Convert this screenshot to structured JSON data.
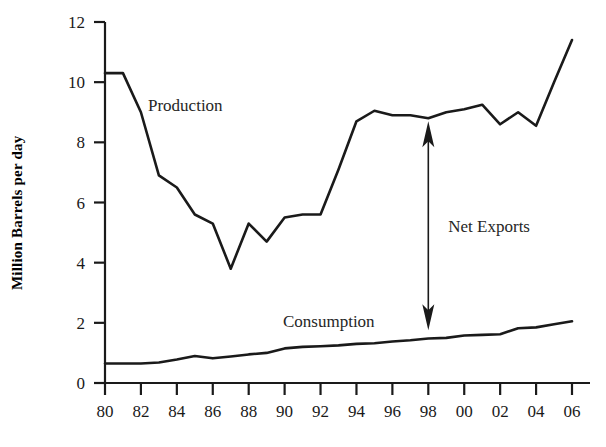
{
  "chart_data": {
    "type": "line",
    "title": "",
    "xlabel": "",
    "ylabel": "Million Barrels per day",
    "xlim": [
      1980,
      2006
    ],
    "ylim": [
      0,
      12
    ],
    "grid": false,
    "legend_position": "inline-annotation",
    "x": [
      1980,
      1981,
      1982,
      1983,
      1984,
      1985,
      1986,
      1987,
      1988,
      1989,
      1990,
      1991,
      1992,
      1993,
      1994,
      1995,
      1996,
      1997,
      1998,
      1999,
      2000,
      2001,
      2002,
      2003,
      2004,
      2005,
      2006
    ],
    "xtick_labels": [
      "80",
      "82",
      "84",
      "86",
      "88",
      "90",
      "92",
      "94",
      "96",
      "98",
      "00",
      "02",
      "04",
      "06"
    ],
    "xtick_values": [
      1980,
      1982,
      1984,
      1986,
      1988,
      1990,
      1992,
      1994,
      1996,
      1998,
      2000,
      2002,
      2004,
      2006
    ],
    "ytick_labels": [
      "0",
      "2",
      "4",
      "6",
      "8",
      "10",
      "12"
    ],
    "ytick_values": [
      0,
      2,
      4,
      6,
      8,
      10,
      12
    ],
    "series": [
      {
        "name": "Production",
        "label_text": "Production",
        "values": [
          10.3,
          10.3,
          9.0,
          6.9,
          6.5,
          5.6,
          5.3,
          3.8,
          5.3,
          4.7,
          5.5,
          5.6,
          5.6,
          7.1,
          8.7,
          9.05,
          8.9,
          8.9,
          8.8,
          9.0,
          9.1,
          9.25,
          8.6,
          9.0,
          8.55,
          10.0,
          11.4
        ]
      },
      {
        "name": "Consumption",
        "label_text": "Consumption",
        "values": [
          0.65,
          0.65,
          0.65,
          0.68,
          0.78,
          0.9,
          0.82,
          0.88,
          0.95,
          1.0,
          1.15,
          1.2,
          1.22,
          1.25,
          1.3,
          1.32,
          1.38,
          1.42,
          1.48,
          1.5,
          1.58,
          1.6,
          1.62,
          1.82,
          1.85,
          1.95,
          2.05
        ]
      }
    ],
    "annotations": [
      {
        "name": "net-exports",
        "text": "Net Exports",
        "arrow": "double-headed-vertical",
        "x": 1998,
        "y_top": 8.7,
        "y_bottom": 1.75
      }
    ]
  }
}
